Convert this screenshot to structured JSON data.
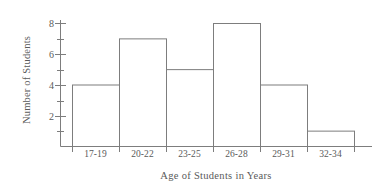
{
  "chart_data": {
    "type": "bar",
    "title": "",
    "subtitle": "",
    "xlabel": "Age of Students in Years",
    "ylabel": "Number of Students",
    "categories": [
      "17-19",
      "20-22",
      "23-25",
      "26-28",
      "29-31",
      "32-34"
    ],
    "values": [
      4,
      7,
      5,
      8,
      4,
      1
    ],
    "series": [
      {
        "name": "Number of Students",
        "values": [
          4,
          7,
          5,
          8,
          4,
          1
        ]
      }
    ],
    "ylim": [
      0,
      8.5
    ],
    "y_major_ticks": [
      2,
      4,
      6,
      8
    ],
    "y_major_tick_labels": [
      "2",
      "4",
      "6",
      "8"
    ],
    "y_minor_ticks": [
      1,
      3,
      5,
      7
    ],
    "grid": false,
    "legend": false,
    "legend_position": "none",
    "bar_style": "outline",
    "bar_fill_color": "#ffffff",
    "bar_stroke_color": "#7d7d7d",
    "axis_color": "#7d7d7d",
    "text_color": "#5a5a5a",
    "background_color": "#ffffff",
    "annotations": []
  }
}
